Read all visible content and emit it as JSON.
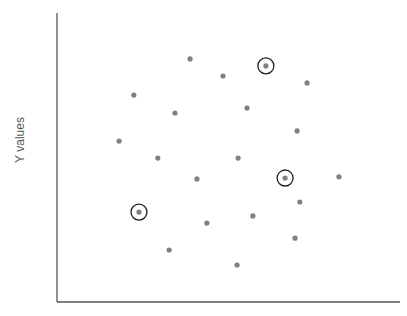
{
  "chart_data": {
    "type": "scatter",
    "title": "",
    "xlabel": "",
    "ylabel": "Y values",
    "xlim": [
      0,
      100
    ],
    "ylim": [
      0,
      100
    ],
    "grid": false,
    "legend": null,
    "point_color": "#808080",
    "axis_color": "#555555",
    "highlight_color": "#222222",
    "points": [
      {
        "x": 38.8,
        "y": 84.1,
        "highlighted": false
      },
      {
        "x": 48.4,
        "y": 78.2,
        "highlighted": false
      },
      {
        "x": 60.9,
        "y": 81.7,
        "highlighted": true
      },
      {
        "x": 72.9,
        "y": 75.8,
        "highlighted": false
      },
      {
        "x": 22.4,
        "y": 71.6,
        "highlighted": false
      },
      {
        "x": 34.4,
        "y": 65.4,
        "highlighted": false
      },
      {
        "x": 55.4,
        "y": 67.1,
        "highlighted": false
      },
      {
        "x": 70.0,
        "y": 59.2,
        "highlighted": false
      },
      {
        "x": 18.1,
        "y": 55.7,
        "highlighted": false
      },
      {
        "x": 29.4,
        "y": 49.8,
        "highlighted": false
      },
      {
        "x": 52.8,
        "y": 49.8,
        "highlighted": false
      },
      {
        "x": 40.8,
        "y": 42.6,
        "highlighted": false
      },
      {
        "x": 66.5,
        "y": 42.9,
        "highlighted": true
      },
      {
        "x": 82.2,
        "y": 43.3,
        "highlighted": false
      },
      {
        "x": 70.8,
        "y": 34.6,
        "highlighted": false
      },
      {
        "x": 23.9,
        "y": 31.1,
        "highlighted": true
      },
      {
        "x": 57.1,
        "y": 29.8,
        "highlighted": false
      },
      {
        "x": 43.7,
        "y": 27.3,
        "highlighted": false
      },
      {
        "x": 69.4,
        "y": 22.1,
        "highlighted": false
      },
      {
        "x": 32.7,
        "y": 18.0,
        "highlighted": false
      },
      {
        "x": 52.5,
        "y": 12.8,
        "highlighted": false
      }
    ]
  }
}
